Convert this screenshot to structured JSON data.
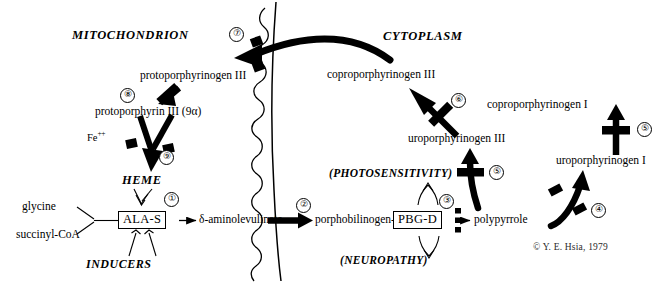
{
  "figure": {
    "copyright": "© Y. E. Hsia, 1979"
  },
  "compartments": {
    "mitochondrion": "MITOCHONDRION",
    "cytoplasm": "CYTOPLASM"
  },
  "compounds": {
    "glycine": "glycine",
    "succinyl_coa": "succinyl-CoA",
    "inducers": "INDUCERS",
    "heme": "HEME",
    "iron": "Fe",
    "iron_charge": "++",
    "ala_s": "ALA-S",
    "aminolevulinate": "δ-aminolevulinate",
    "porphobilinogen": "porphobilinogen-",
    "pbg_d": "PBG-D",
    "polypyrrole": "polypyrrole",
    "uroporphyrinogen_i": "uroporphyrinogen I",
    "uroporphyrinogen_iii": "uroporphyrinogen III",
    "coproporphyrinogen_i": "coproporphyrinogen I",
    "coproporphyrinogen_iii": "coproporphyrinogen III",
    "protoporphyrinogen_iii": "protoporphyrinogen III",
    "protoporphyrin_iii": "protoporphyrin III (9α)"
  },
  "symptoms": {
    "photosensitivity": "(PHOTOSENSITIVITY)",
    "neuropathy": "(NEUROPATHY)"
  },
  "steps": [
    {
      "id": "step-1",
      "label": "①",
      "number": "1",
      "meaning": "ALA synthase feedback inhibition by heme",
      "blocked": false
    },
    {
      "id": "step-2",
      "label": "②",
      "number": "2",
      "meaning": "ALA dehydratase",
      "blocked": false
    },
    {
      "id": "step-3",
      "label": "③",
      "number": "3",
      "meaning": "porphobilinogen deaminase block",
      "blocked": true
    },
    {
      "id": "step-4",
      "label": "④",
      "number": "4",
      "meaning": "uroporphyrinogen I synthesis block",
      "blocked": true
    },
    {
      "id": "step-5a",
      "label": "⑤",
      "number": "5",
      "meaning": "uroporphyrinogen decarboxylase (I branch)",
      "blocked": true
    },
    {
      "id": "step-5b",
      "label": "⑤",
      "number": "5",
      "meaning": "uroporphyrinogen decarboxylase (III branch)",
      "blocked": true
    },
    {
      "id": "step-6",
      "label": "⑥",
      "number": "6",
      "meaning": "coproporphyrinogen oxidase block",
      "blocked": true
    },
    {
      "id": "step-7",
      "label": "⑦",
      "number": "7",
      "meaning": "protoporphyrinogen transport block",
      "blocked": true
    },
    {
      "id": "step-8",
      "label": "⑧",
      "number": "8",
      "meaning": "protoporphyrinogen oxidase block",
      "blocked": true
    },
    {
      "id": "step-9",
      "label": "⑨",
      "number": "9",
      "meaning": "ferrochelatase block",
      "blocked": true
    }
  ],
  "colors": {
    "ink": "#000000",
    "background": "#ffffff",
    "copyright_ink": "#2a2a2a"
  }
}
